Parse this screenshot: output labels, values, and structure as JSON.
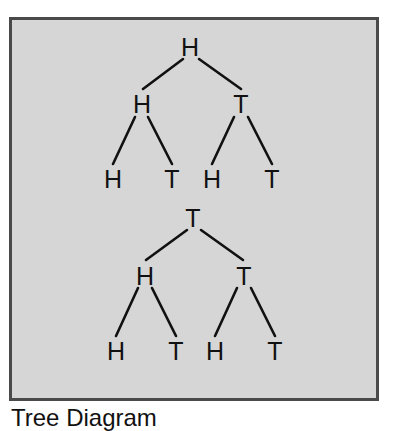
{
  "diagram": {
    "caption": "Tree Diagram",
    "colors": {
      "panel_bg": "#d6d6d6",
      "border": "#4a4a4a",
      "ink": "#111111"
    },
    "trees": [
      {
        "root": "H",
        "level2": [
          "H",
          "T"
        ],
        "leaves": [
          "H",
          "T",
          "H",
          "T"
        ]
      },
      {
        "root": "T",
        "level2": [
          "H",
          "T"
        ],
        "leaves": [
          "H",
          "T",
          "H",
          "T"
        ]
      }
    ]
  }
}
